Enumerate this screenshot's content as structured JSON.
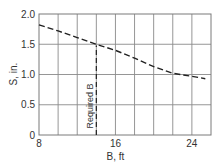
{
  "chart_data": {
    "type": "line",
    "title": "",
    "xlabel": "B, ft",
    "ylabel": "S, in.",
    "xlim": [
      8,
      26
    ],
    "ylim": [
      0,
      2.0
    ],
    "x_ticks": [
      8,
      16,
      24
    ],
    "x_tick_labels": [
      "8",
      "16",
      "24"
    ],
    "y_ticks": [
      0,
      0.5,
      1.0,
      1.5,
      2.0
    ],
    "y_tick_labels": [
      "0",
      "0.5",
      "1.0",
      "1.5",
      "2.0"
    ],
    "grid": true,
    "grid_x_step": 2,
    "grid_y_step": 0.5,
    "series": [
      {
        "name": "S vs B",
        "style": "dashed",
        "x": [
          8,
          10,
          12,
          14,
          16,
          18,
          20,
          22,
          24,
          25.4
        ],
        "y": [
          1.82,
          1.72,
          1.61,
          1.5,
          1.4,
          1.27,
          1.13,
          1.02,
          0.97,
          0.93
        ]
      }
    ],
    "annotations": [
      {
        "type": "vertical-dashed-line",
        "x": 14,
        "y_from": 0,
        "y_to": 1.48,
        "label": "Required B"
      }
    ],
    "legend": null
  },
  "labels": {
    "xlabel": "B, ft",
    "ylabel": "S, in.",
    "required_b": "Required B",
    "x_ticks": [
      "8",
      "16",
      "24"
    ],
    "y_ticks": [
      "0",
      "0.5",
      "1.0",
      "1.5",
      "2.0"
    ]
  }
}
